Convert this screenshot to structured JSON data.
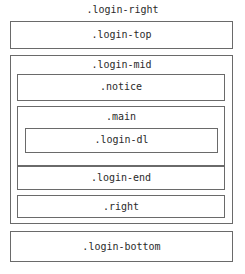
{
  "diagram": {
    "outer_label": ".login-right",
    "top": ".login-top",
    "mid": {
      "label": ".login-mid",
      "notice": ".notice",
      "main": {
        "label": ".main",
        "login_dl": ".login-dl"
      },
      "login_end": ".login-end",
      "right": ".right"
    },
    "bottom": ".login-bottom"
  }
}
